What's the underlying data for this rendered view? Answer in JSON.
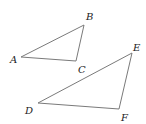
{
  "diagram": {
    "stroke_color": "#7a7a7a",
    "triangles": [
      {
        "name": "ABC",
        "vertices": {
          "A": {
            "x": 21,
            "y": 57,
            "label": "A",
            "lx": 10,
            "ly": 63
          },
          "B": {
            "x": 84,
            "y": 25,
            "label": "B",
            "lx": 86,
            "ly": 20
          },
          "C": {
            "x": 76,
            "y": 61,
            "label": "C",
            "lx": 78,
            "ly": 73
          }
        }
      },
      {
        "name": "DEF",
        "vertices": {
          "D": {
            "x": 38,
            "y": 103,
            "label": "D",
            "lx": 25,
            "ly": 114
          },
          "E": {
            "x": 132,
            "y": 53,
            "label": "E",
            "lx": 133,
            "ly": 51
          },
          "F": {
            "x": 119,
            "y": 109,
            "label": "F",
            "lx": 121,
            "ly": 121
          }
        }
      }
    ]
  }
}
